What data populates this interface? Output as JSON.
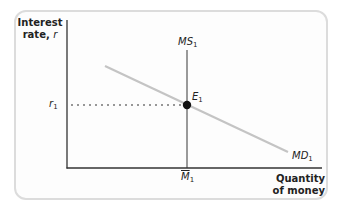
{
  "diagram": {
    "y_axis": {
      "title_line1": "Interest",
      "title_line2": "rate, ",
      "title_var": "r"
    },
    "x_axis": {
      "title_line1": "Quantity",
      "title_line2": "of money"
    },
    "curves": {
      "money_supply": {
        "label": "MS",
        "subscript": "1",
        "type": "vertical"
      },
      "money_demand": {
        "label": "MD",
        "subscript": "1",
        "type": "downward-sloping"
      }
    },
    "equilibrium": {
      "label": "E",
      "subscript": "1"
    },
    "y_tick": {
      "label": "r",
      "subscript": "1"
    },
    "x_tick": {
      "label": "M",
      "subscript": "1",
      "overline": true
    },
    "colors": {
      "axis": "#333333",
      "ms_line": "#999999",
      "md_line": "#c0c0c0",
      "dot": "#111111",
      "panel_border": "#dcdcdc"
    }
  }
}
